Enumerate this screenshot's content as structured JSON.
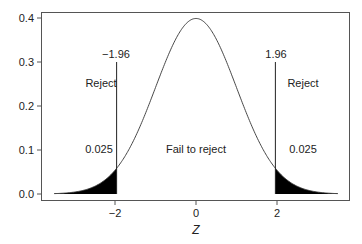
{
  "chart_data": {
    "type": "line",
    "title": "",
    "xlabel": "Z",
    "ylabel": "",
    "xlim": [
      -3.5,
      3.5
    ],
    "ylim": [
      0.0,
      0.4
    ],
    "grid": false,
    "legend": null,
    "series": [
      {
        "name": "Standard normal density",
        "function": "pdf N(0,1)",
        "x": [
          -3.5,
          -3,
          -2.5,
          -2,
          -1.96,
          -1.5,
          -1,
          -0.5,
          0,
          0.5,
          1,
          1.5,
          1.96,
          2,
          2.5,
          3,
          3.5
        ],
        "y": [
          0.001,
          0.004,
          0.018,
          0.054,
          0.058,
          0.13,
          0.242,
          0.352,
          0.399,
          0.352,
          0.242,
          0.13,
          0.058,
          0.054,
          0.018,
          0.004,
          0.001
        ]
      }
    ],
    "shaded_regions": [
      {
        "from": -3.5,
        "to": -1.96,
        "area": 0.025
      },
      {
        "from": 1.96,
        "to": 3.5,
        "area": 0.025
      }
    ],
    "critical_values": [
      -1.96,
      1.96
    ],
    "x_ticks": [
      -2,
      0,
      2
    ],
    "y_ticks": [
      0.0,
      0.1,
      0.2,
      0.3,
      0.4
    ]
  },
  "axis": {
    "x_title": "Z",
    "x_tick_labels": [
      "−2",
      "0",
      "2"
    ],
    "y_tick_labels": [
      "0.0",
      "0.1",
      "0.2",
      "0.3",
      "0.4"
    ]
  },
  "annotations": {
    "left_critical": "−1.96",
    "right_critical": "1.96",
    "left_region": "Reject",
    "right_region": "Reject",
    "center_region": "Fail to reject",
    "left_area": "0.025",
    "right_area": "0.025"
  }
}
